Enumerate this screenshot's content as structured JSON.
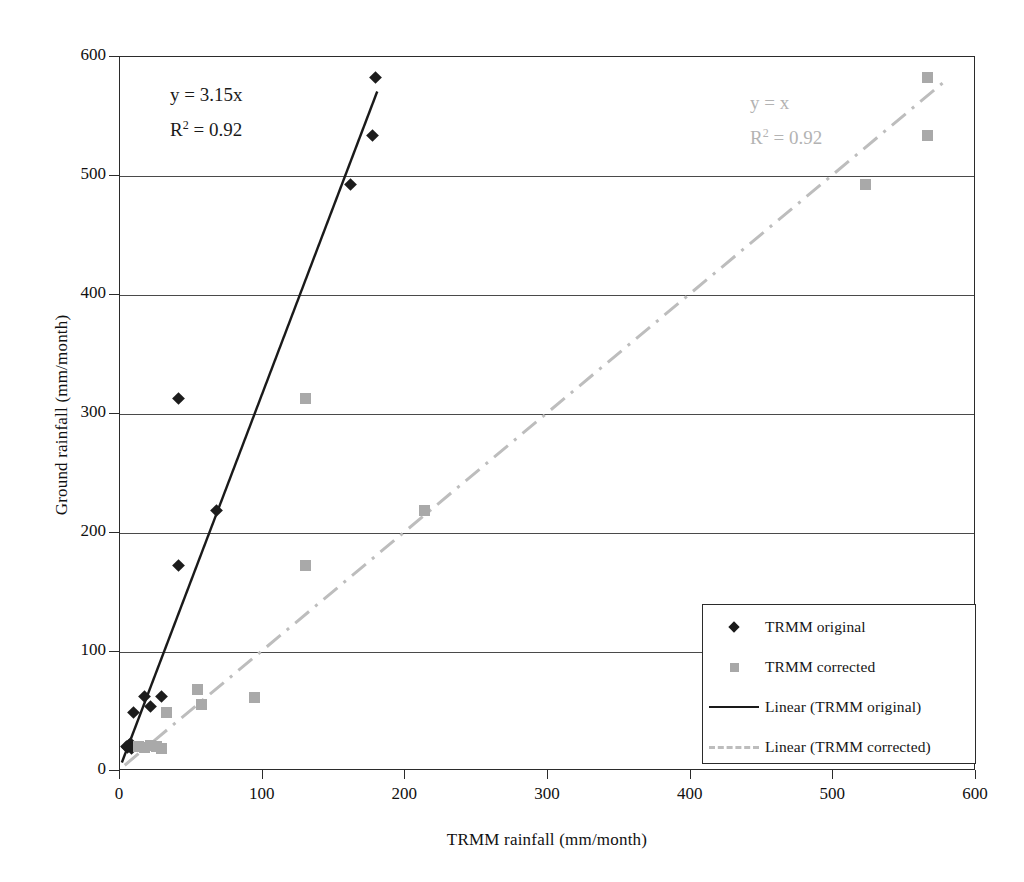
{
  "chart_data": {
    "type": "scatter",
    "title": "",
    "xlabel": "TRMM rainfall (mm/month)",
    "ylabel": "Ground rainfall (mm/month)",
    "xlim": [
      0,
      600
    ],
    "ylim": [
      0,
      600
    ],
    "xticks": [
      0,
      100,
      200,
      300,
      400,
      500,
      600
    ],
    "yticks": [
      0,
      100,
      200,
      300,
      400,
      500,
      600
    ],
    "grid": "horizontal",
    "legend_position": "bottom-right",
    "series": [
      {
        "name": "TRMM original",
        "marker": "diamond",
        "color": "#1c1c1c",
        "points": [
          [
            5,
            20
          ],
          [
            6,
            19
          ],
          [
            7,
            21
          ],
          [
            8,
            22
          ],
          [
            9,
            18
          ],
          [
            10,
            48
          ],
          [
            18,
            62
          ],
          [
            22,
            53
          ],
          [
            30,
            62
          ],
          [
            42,
            312
          ],
          [
            42,
            172
          ],
          [
            68,
            218
          ],
          [
            162,
            492
          ],
          [
            178,
            533
          ],
          [
            180,
            582
          ]
        ]
      },
      {
        "name": "TRMM corrected",
        "marker": "square",
        "color": "#a9a9a9",
        "points": [
          [
            14,
            20
          ],
          [
            18,
            19
          ],
          [
            22,
            21
          ],
          [
            26,
            20
          ],
          [
            30,
            18
          ],
          [
            33,
            48
          ],
          [
            55,
            68
          ],
          [
            58,
            55
          ],
          [
            95,
            61
          ],
          [
            131,
            312
          ],
          [
            131,
            172
          ],
          [
            214,
            218
          ],
          [
            523,
            492
          ],
          [
            567,
            533
          ],
          [
            567,
            582
          ]
        ]
      }
    ],
    "trendlines": [
      {
        "name": "Linear (TRMM original)",
        "equation": "y = 3.15x",
        "r_squared": "R2 = 0.92",
        "slope": 3.15,
        "intercept": 0,
        "style": "solid",
        "color": "#1a1a1a",
        "x_from": 2,
        "x_to": 181
      },
      {
        "name": "Linear (TRMM corrected)",
        "equation": "y = x",
        "r_squared": "R2 = 0.92",
        "slope": 1.0,
        "intercept": 0,
        "style": "dash-dot",
        "color": "#bdbdbd",
        "x_from": 4,
        "x_to": 580
      }
    ]
  },
  "annotations": {
    "black": {
      "equation": "y = 3.15x",
      "r_label": "R",
      "r_exponent": "2",
      "r_value": " = 0.92"
    },
    "gray": {
      "equation": "y = x",
      "r_label": "R",
      "r_exponent": "2",
      "r_value": " = 0.92"
    }
  },
  "legend": {
    "items": [
      {
        "label": "TRMM original",
        "key": "diamond-marker-icon"
      },
      {
        "label": "TRMM corrected",
        "key": "square-marker-icon"
      },
      {
        "label": "Linear (TRMM original)",
        "key": "solid-line-icon"
      },
      {
        "label": "Linear (TRMM corrected)",
        "key": "dashdot-line-icon"
      }
    ]
  },
  "axes": {
    "x_title": "TRMM rainfall (mm/month)",
    "y_title": "Ground rainfall (mm/month)",
    "x_tick_labels": [
      "0",
      "100",
      "200",
      "300",
      "400",
      "500",
      "600"
    ],
    "y_tick_labels": [
      "0",
      "100",
      "200",
      "300",
      "400",
      "500",
      "600"
    ]
  }
}
